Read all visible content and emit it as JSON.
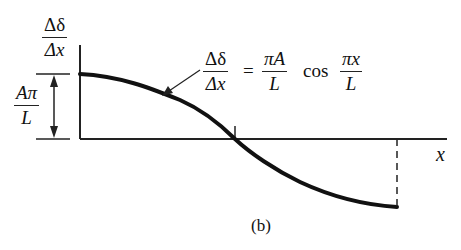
{
  "diagram": {
    "y_label": {
      "numerator": "Δδ",
      "denominator": "Δx"
    },
    "amplitude_label": {
      "numerator": "Aπ",
      "denominator": "L"
    },
    "equation": {
      "lhs": {
        "numerator": "Δδ",
        "denominator": "Δx"
      },
      "equals": "=",
      "coef": {
        "numerator": "πA",
        "denominator": "L"
      },
      "func": "cos",
      "arg": {
        "numerator": "πx",
        "denominator": "L"
      }
    },
    "x_label": "x",
    "caption": "(b)",
    "colors": {
      "ink": "#111111",
      "background": "#ffffff"
    }
  }
}
